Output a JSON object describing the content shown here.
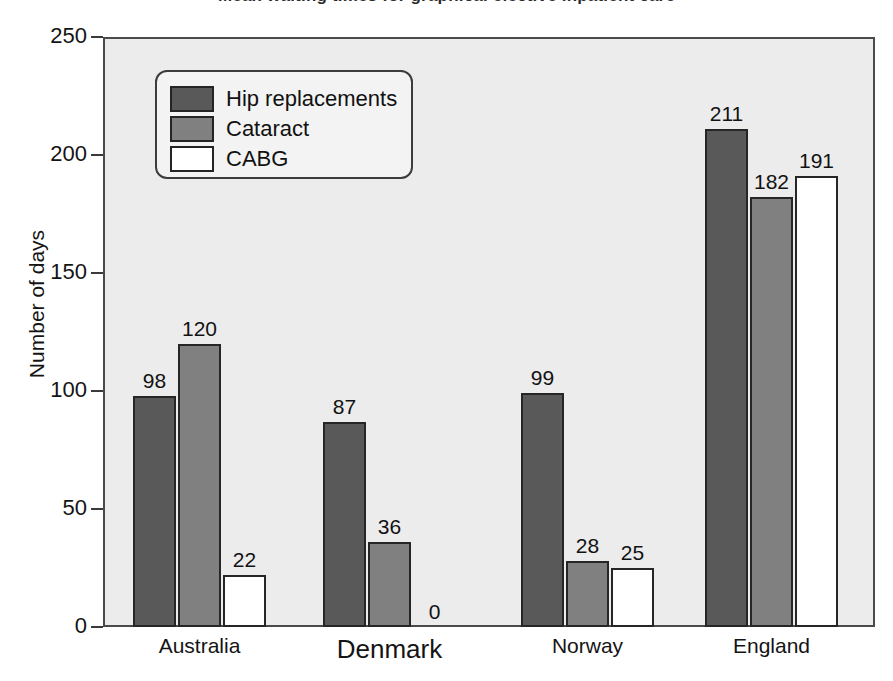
{
  "chart_data": {
    "type": "bar",
    "title": "Mean waiting times for graphical elective inpatient care",
    "xlabel": "",
    "ylabel": "Number of days",
    "ylim": [
      0,
      250
    ],
    "yticks": [
      0,
      50,
      100,
      150,
      200,
      250
    ],
    "grid": false,
    "legend_position": "top-left",
    "categories": [
      "Australia",
      "Denmark",
      "Norway",
      "England"
    ],
    "series": [
      {
        "name": "Hip replacements",
        "color": "#595959",
        "values": [
          98,
          87,
          99,
          211
        ]
      },
      {
        "name": "Cataract",
        "color": "#808080",
        "values": [
          120,
          36,
          28,
          182
        ]
      },
      {
        "name": "CABG",
        "color": "#ffffff",
        "values": [
          22,
          0,
          25,
          191
        ]
      }
    ]
  },
  "axis": {
    "y_title": "Number of days",
    "y_tick_labels": [
      "250",
      "200",
      "150",
      "100",
      "50",
      "0"
    ]
  },
  "legend": {
    "items": [
      {
        "label": "Hip replacements",
        "swatch": "#595959"
      },
      {
        "label": "Cataract",
        "swatch": "#808080"
      },
      {
        "label": "CABG",
        "swatch": "#ffffff"
      }
    ]
  },
  "categories": [
    {
      "label": "Australia",
      "emphasis": false
    },
    {
      "label": "Denmark",
      "emphasis": true
    },
    {
      "label": "Norway",
      "emphasis": false
    },
    {
      "label": "England",
      "emphasis": false
    }
  ],
  "values_text": {
    "australia": [
      "98",
      "120",
      "22"
    ],
    "denmark": [
      "87",
      "36",
      "0"
    ],
    "norway": [
      "99",
      "28",
      "25"
    ],
    "england": [
      "211",
      "182",
      "191"
    ]
  }
}
